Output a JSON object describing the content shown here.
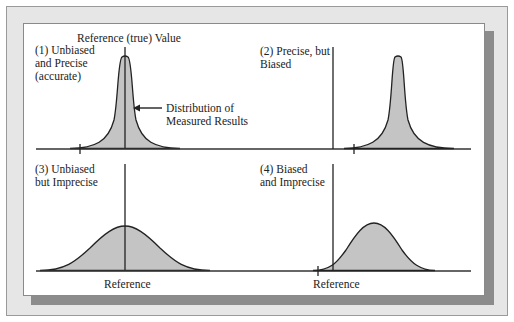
{
  "diagram": {
    "title_reference": "Reference (true) Value",
    "annotation": {
      "line1": "Distribution of",
      "line2": "Measured Results"
    },
    "panels": [
      {
        "id": 1,
        "label_lines": [
          "(1) Unbiased",
          "and Precise",
          "(accurate)"
        ],
        "bias": "none",
        "precision": "high"
      },
      {
        "id": 2,
        "label_lines": [
          "(2) Precise, but",
          "Biased"
        ],
        "bias": "right",
        "precision": "high"
      },
      {
        "id": 3,
        "label_lines": [
          "(3) Unbiased",
          "but Imprecise"
        ],
        "bias": "none",
        "precision": "low",
        "axis_label": "Reference"
      },
      {
        "id": 4,
        "label_lines": [
          "(4) Biased",
          "and Imprecise"
        ],
        "bias": "right",
        "precision": "low",
        "axis_label": "Reference"
      }
    ],
    "colors": {
      "fill": "#c4c4c4",
      "line": "#222222",
      "frame": "#e6e6e6",
      "shadow": "#8c8c8c"
    }
  }
}
